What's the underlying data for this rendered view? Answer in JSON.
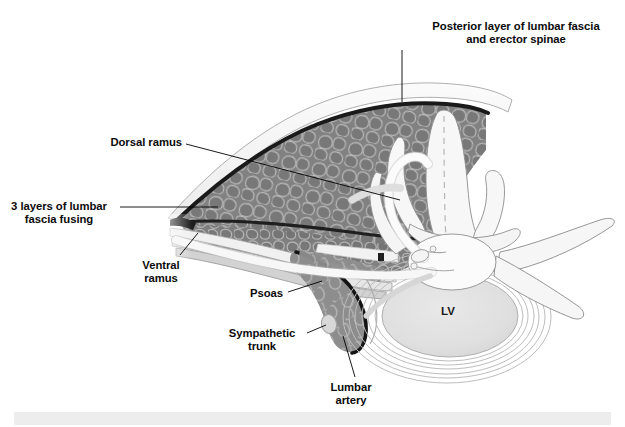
{
  "figure": {
    "background_color": "#ffffff",
    "footer_strip_color": "#ededed",
    "label_color": "#0b0b0b",
    "leader_line_color": "#000000",
    "muscle_fill": "#7e7e7e",
    "muscle_fascicle_outline": "#b9b9b9",
    "fascia_dark": "#1c1c1c",
    "bone_fill": "#f4f4f4",
    "bone_outline": "#8e8e8e",
    "disc_fill": "#e2e2e2"
  },
  "labels": [
    {
      "id": "posterior-layer",
      "name": "posterior-layer-of-lumbar-fascia-and-erector-spinae",
      "line1": "Posterior layer of lumbar fascia",
      "line2": "and erector spinae",
      "align": "center",
      "x": 401,
      "y": 20,
      "width": 230,
      "leader": {
        "x1": 402,
        "y1": 50,
        "x2": 402,
        "y2": 102
      }
    },
    {
      "id": "dorsal-ramus",
      "name": "dorsal-ramus",
      "line1": "Dorsal ramus",
      "line2": "",
      "align": "right",
      "x": 22,
      "y": 136,
      "width": 160,
      "leader": {
        "x1": 186,
        "y1": 144,
        "x2": 400,
        "y2": 200
      }
    },
    {
      "id": "three-layers",
      "name": "3-layers-of-lumbar-fascia-fusing",
      "line1": "3 layers of lumbar",
      "line2": "fascia fusing",
      "align": "center",
      "x": 3,
      "y": 200,
      "width": 112,
      "leader": {
        "x1": 120,
        "y1": 207,
        "x2": 218,
        "y2": 207
      }
    },
    {
      "id": "ventral-ramus",
      "name": "ventral-ramus",
      "line1": "Ventral",
      "line2": "ramus",
      "align": "center",
      "x": 130,
      "y": 259,
      "width": 62,
      "leader": {
        "x1": 180,
        "y1": 255,
        "x2": 198,
        "y2": 233
      }
    },
    {
      "id": "psoas",
      "name": "psoas",
      "line1": "Psoas",
      "line2": "",
      "align": "right",
      "x": 228,
      "y": 287,
      "width": 55,
      "leader": {
        "x1": 288,
        "y1": 292,
        "x2": 322,
        "y2": 281
      }
    },
    {
      "id": "sympathetic-trunk",
      "name": "sympathetic-trunk",
      "line1": "Sympathetic",
      "line2": "trunk",
      "align": "center",
      "x": 222,
      "y": 327,
      "width": 80,
      "leader": {
        "x1": 307,
        "y1": 333,
        "x2": 326,
        "y2": 325
      }
    },
    {
      "id": "lumbar-artery",
      "name": "lumbar-artery",
      "line1": "Lumbar",
      "line2": "artery",
      "align": "center",
      "x": 320,
      "y": 381,
      "width": 62,
      "leader": {
        "x1": 355,
        "y1": 377,
        "x2": 343,
        "y2": 336
      }
    }
  ],
  "structures": {
    "vertebral_body_label": "LV",
    "vertebral_body_label_x": 441,
    "vertebral_body_label_y": 315,
    "names": [
      "spinous-process",
      "lamina",
      "superior-articular-process",
      "transverse-process",
      "vertebral-body",
      "spinal-canal",
      "intervertebral-disc",
      "erector-spinae-muscle",
      "psoas-muscle",
      "posterior-lumbar-fascia",
      "middle-lumbar-fascia",
      "anterior-lumbar-fascia",
      "dorsal-ramus-nerve",
      "ventral-ramus-nerve",
      "sympathetic-trunk-ganglion",
      "lumbar-artery-vessel",
      "skin-subcutaneous-layer"
    ]
  }
}
